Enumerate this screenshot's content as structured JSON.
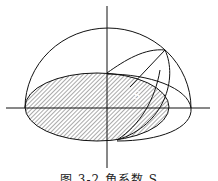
{
  "figure": {
    "label": "S",
    "caption": "图 3-2  角系数 S",
    "colors": {
      "stroke": "#111111",
      "hatch": "#555555",
      "background": "#ffffff"
    }
  }
}
